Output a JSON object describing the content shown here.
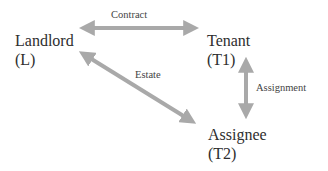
{
  "diagram": {
    "nodes": [
      {
        "id": "landlord",
        "name": "Landlord",
        "abbr": "(L)"
      },
      {
        "id": "tenant",
        "name": "Tenant",
        "abbr": "(T1)"
      },
      {
        "id": "assignee",
        "name": "Assignee",
        "abbr": "(T2)"
      }
    ],
    "edges": [
      {
        "from": "landlord",
        "to": "tenant",
        "label": "Contract",
        "direction": "both"
      },
      {
        "from": "landlord",
        "to": "assignee",
        "label": "Estate",
        "direction": "both"
      },
      {
        "from": "tenant",
        "to": "assignee",
        "label": "Assignment",
        "direction": "both"
      }
    ],
    "colors": {
      "arrow": "#a9a9a9",
      "text": "#2e2e2e",
      "background": "#ffffff"
    }
  }
}
